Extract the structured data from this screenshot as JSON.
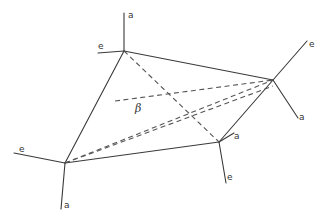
{
  "diagram": {
    "type": "crystal-grain-tetrahedron",
    "vertices": [
      {
        "id": "top",
        "x": 124,
        "y": 51
      },
      {
        "id": "right",
        "x": 273,
        "y": 80
      },
      {
        "id": "lower-right",
        "x": 219,
        "y": 142
      },
      {
        "id": "left",
        "x": 65,
        "y": 163
      }
    ],
    "labels": {
      "top_a": "a",
      "top_e": "e",
      "right_e": "e",
      "right_a": "a",
      "lower_right_a": "a",
      "lower_right_e": "e",
      "left_e": "e",
      "left_a": "a",
      "angle": "β"
    },
    "colors": {
      "line": "#3a3a3a",
      "background": "#ffffff"
    }
  }
}
